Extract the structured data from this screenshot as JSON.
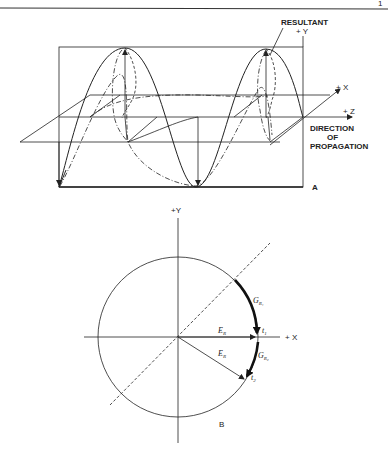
{
  "page": {
    "page_number_fragment": "1"
  },
  "figure_a": {
    "panel_label": "A",
    "labels": {
      "resultant": "RESULTANT",
      "plus_y": "+ Y",
      "plus_x": "+ X",
      "plus_z": "+ Z",
      "direction_line1": "DIRECTION",
      "direction_line2": "OF",
      "direction_line3": "PROPAGATION"
    }
  },
  "figure_b": {
    "panel_label": "B",
    "labels": {
      "plus_y": "+Y",
      "plus_x": "+ X",
      "er_1": "E",
      "er_1_sub": "R",
      "er_2": "E",
      "er_2_sub": "R",
      "gr1": "G",
      "gr1_sub": "R₁",
      "gr2": "G",
      "gr2_sub": "R₂",
      "t1": "t",
      "t1_sub": "1",
      "t2": "t",
      "t2_sub": "2"
    }
  },
  "colors": {
    "ink": "#222222",
    "background": "#ffffff"
  }
}
